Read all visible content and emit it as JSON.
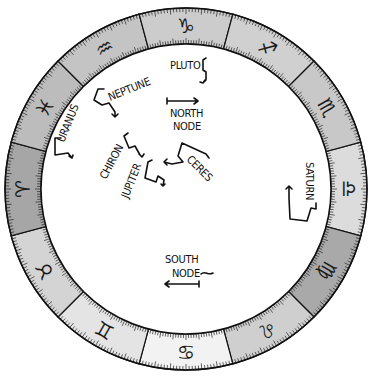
{
  "wheel": {
    "center": [
      186,
      189
    ],
    "outer_radius": 181,
    "inner_radius": 145,
    "signs": [
      {
        "name": "Libra",
        "glyph": "♎",
        "angle": 0,
        "shade": "#dcdcdc"
      },
      {
        "name": "Virgo",
        "glyph": "♍",
        "angle": 30,
        "shade": "#a9a9a9"
      },
      {
        "name": "Leo",
        "glyph": "♌",
        "angle": 60,
        "shade": "#cfcfcf"
      },
      {
        "name": "Cancer",
        "glyph": "♋",
        "angle": 90,
        "shade": "#f2f2f2"
      },
      {
        "name": "Gemini",
        "glyph": "♊",
        "angle": 120,
        "shade": "#e4e4e4"
      },
      {
        "name": "Taurus",
        "glyph": "♉",
        "angle": 150,
        "shade": "#d4d4d4"
      },
      {
        "name": "Aries",
        "glyph": "♈",
        "angle": 180,
        "shade": "#a6a6a6"
      },
      {
        "name": "Pisces",
        "glyph": "♓",
        "angle": 210,
        "shade": "#bcbcbc"
      },
      {
        "name": "Aquarius",
        "glyph": "♒",
        "angle": 240,
        "shade": "#c4c4c4"
      },
      {
        "name": "Capricorn",
        "glyph": "♑",
        "angle": 270,
        "shade": "#cccccc"
      },
      {
        "name": "Sagittarius",
        "glyph": "♐",
        "angle": 300,
        "shade": "#d0d0d0"
      },
      {
        "name": "Scorpio",
        "glyph": "♏",
        "angle": 330,
        "shade": "#c8c8c8"
      }
    ]
  },
  "bodies": {
    "pluto": "PLUTO",
    "neptune": "NEPTUNE",
    "uranus": "URANUS",
    "north_node_line1": "NORTH",
    "north_node_line2": "NODE",
    "chiron": "CHIRON",
    "jupiter": "JUPITER",
    "ceres": "CERES",
    "saturn": "SATURN",
    "south_node_line1": "SOUTH",
    "south_node_line2": "NODE"
  }
}
